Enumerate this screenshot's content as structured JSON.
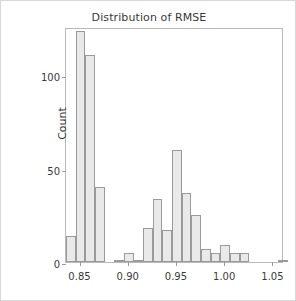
{
  "chart_data": {
    "type": "bar",
    "title": "Distribution of RMSE",
    "xlabel": "",
    "ylabel": "Count",
    "grid": false,
    "legend": null,
    "xlim": [
      0.836,
      1.062
    ],
    "ylim": [
      0,
      126
    ],
    "bin_width": 0.01,
    "xticks": [
      "0.85",
      "0.90",
      "0.95",
      "1.00",
      "1.05"
    ],
    "xtick_values": [
      0.85,
      0.9,
      0.95,
      1.0,
      1.05
    ],
    "yticks": [
      "0",
      "50",
      "100"
    ],
    "ytick_values": [
      0,
      50,
      100
    ],
    "bin_starts": [
      0.836,
      0.846,
      0.856,
      0.866,
      0.876,
      0.886,
      0.896,
      0.906,
      0.916,
      0.926,
      0.936,
      0.946,
      0.956,
      0.966,
      0.976,
      0.986,
      0.996,
      1.006,
      1.016,
      1.026,
      1.036,
      1.046,
      1.056
    ],
    "categories": [
      "0.836",
      "0.846",
      "0.856",
      "0.866",
      "0.876",
      "0.886",
      "0.896",
      "0.906",
      "0.916",
      "0.926",
      "0.936",
      "0.946",
      "0.956",
      "0.966",
      "0.976",
      "0.986",
      "0.996",
      "1.006",
      "1.016",
      "1.026",
      "1.036",
      "1.046",
      "1.056"
    ],
    "values": [
      14,
      124,
      111,
      40,
      0,
      1,
      5,
      1,
      18,
      34,
      17,
      60,
      37,
      25,
      7,
      5,
      9,
      5,
      5,
      0,
      0,
      0,
      1
    ],
    "bar_face_color": "#e9e9e9",
    "bar_edge_color": "#9a9a9a",
    "frame_color": "#b9b9b9",
    "text_color": "#3a3a3a",
    "background_color": "#ffffff"
  }
}
